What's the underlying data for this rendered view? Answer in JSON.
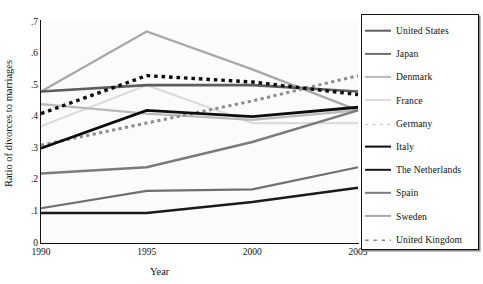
{
  "chart_data": {
    "type": "line",
    "title": "",
    "xlabel": "Year",
    "ylabel": "Ratio of divorces to marriages",
    "x": [
      1990,
      1995,
      2000,
      2005
    ],
    "xtick_labels": [
      "1990",
      "1995",
      "2000",
      "2005"
    ],
    "ytick_labels": [
      "0",
      ".1",
      ".2",
      ".3",
      ".4",
      ".5",
      ".6",
      ".7"
    ],
    "ytick_values": [
      0,
      0.1,
      0.2,
      0.3,
      0.4,
      0.5,
      0.6,
      0.7
    ],
    "ylim": [
      0,
      0.7
    ],
    "xlim": [
      1990,
      2005
    ],
    "grid": false,
    "legend_position": "right-outside",
    "series": [
      {
        "name": "United States",
        "values": [
          0.48,
          0.5,
          0.5,
          0.48
        ],
        "color": "#5e5e5e",
        "style": "solid",
        "width": 2.6
      },
      {
        "name": "Japan",
        "values": [
          0.11,
          0.165,
          0.17,
          0.24
        ],
        "color": "#6f6f6f",
        "style": "solid",
        "width": 2.2
      },
      {
        "name": "Denmark",
        "values": [
          0.44,
          0.41,
          0.39,
          0.42
        ],
        "color": "#b9b9b9",
        "style": "solid",
        "width": 2.2
      },
      {
        "name": "France",
        "values": [
          0.37,
          0.5,
          0.38,
          0.38
        ],
        "color": "#dcdcdc",
        "style": "solid",
        "width": 2.2
      },
      {
        "name": "Germany",
        "values": [
          0.31,
          0.38,
          0.45,
          0.53
        ],
        "color": "#8d8d8d",
        "style": "dotted",
        "width": 3.0
      },
      {
        "name": "Italy",
        "values": [
          0.3,
          0.42,
          0.4,
          0.43
        ],
        "color": "#0d0d0d",
        "style": "solid",
        "width": 2.8
      },
      {
        "name": "The Netherlands",
        "values": [
          0.095,
          0.095,
          0.13,
          0.175
        ],
        "color": "#1a1a1a",
        "style": "solid",
        "width": 2.4
      },
      {
        "name": "Spain",
        "values": [
          0.22,
          0.24,
          0.32,
          0.42
        ],
        "color": "#7b7b7b",
        "style": "solid",
        "width": 2.4
      },
      {
        "name": "Sweden",
        "values": [
          0.48,
          0.67,
          0.55,
          0.42
        ],
        "color": "#a8a8a8",
        "style": "solid",
        "width": 2.2
      },
      {
        "name": "United Kingdom",
        "values": [
          0.41,
          0.53,
          0.51,
          0.47
        ],
        "color": "#0d0d0d",
        "style": "dotted",
        "width": 3.4
      }
    ]
  },
  "legend": {
    "items": [
      {
        "label": "United States"
      },
      {
        "label": "Japan"
      },
      {
        "label": "Denmark"
      },
      {
        "label": "France"
      },
      {
        "label": "Germany"
      },
      {
        "label": "Italy"
      },
      {
        "label": "The Netherlands"
      },
      {
        "label": "Spain"
      },
      {
        "label": "Sweden"
      },
      {
        "label": "United Kingdom"
      }
    ]
  },
  "axes": {
    "y_title": "Ratio of divorces to marriages",
    "x_title": "Year"
  }
}
